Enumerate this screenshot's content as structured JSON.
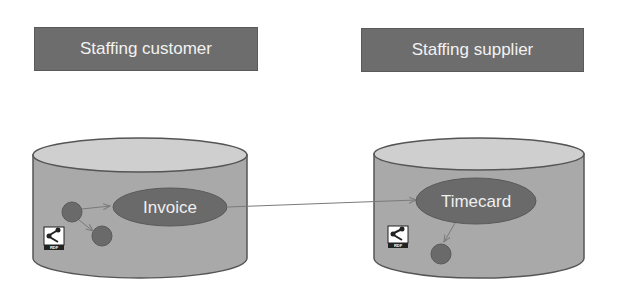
{
  "diagram": {
    "colors": {
      "header_bg": "#6d6d6d",
      "header_text": "#f2f2f2",
      "cylinder_body": "#a9a9a9",
      "cylinder_top": "#cfcfcf",
      "cylinder_stroke": "#555555",
      "node_fill": "#6a6a6a",
      "edge": "#7a7a7a"
    },
    "parties": [
      {
        "title": "Staffing customer",
        "store": {
          "main_node": "Invoice",
          "icon": "rdf-icon",
          "icon_text": "RDF",
          "child_nodes": 2
        }
      },
      {
        "title": "Staffing supplier",
        "store": {
          "main_node": "Timecard",
          "icon": "rdf-icon",
          "icon_text": "RDF",
          "child_nodes": 1
        }
      }
    ],
    "links": [
      {
        "from": "Invoice",
        "to": "Timecard"
      }
    ]
  }
}
